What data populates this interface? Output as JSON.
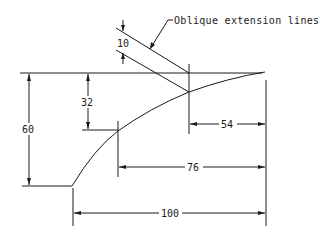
{
  "drawing": {
    "callout_label": "Oblique extension lines",
    "dimensions": {
      "oblique_offset": "10",
      "vertical_inner": "32",
      "vertical_outer": "60",
      "horizontal_short": "54",
      "horizontal_mid": "76",
      "horizontal_overall": "100"
    },
    "colors": {
      "line": "#1a1a1a",
      "background": "#ffffff"
    }
  }
}
